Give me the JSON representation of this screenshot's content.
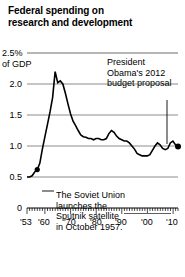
{
  "title": {
    "line1": "Federal spending on",
    "line2": "research and development"
  },
  "axes": {
    "y_unit_top": "2.5%",
    "y_unit_sub": "of GDP",
    "y_ticks": [
      "2.5",
      "2.0",
      "1.5",
      "1.0",
      "0.5",
      "0"
    ],
    "y_tick_labels_shown": [
      "2.0",
      "1.5",
      "1.0",
      "0.5",
      "0"
    ],
    "x_tick_labels": [
      "'53",
      "'60",
      "'70",
      "'80",
      "'90",
      "'00",
      "'10"
    ]
  },
  "annotations": {
    "obama": {
      "line1": "President",
      "line2": "Obama's 2012",
      "line3": "budget proposal"
    },
    "sputnik": {
      "line1": "The Soviet Union",
      "line2": "launches the",
      "line3": "Sputnik satellite",
      "line4": "in October 1957."
    }
  },
  "colors": {
    "line": "#000000",
    "gridline": "#8c8c8c",
    "axis": "#000000",
    "text": "#000000",
    "background": "#ffffff"
  },
  "chart_data": {
    "type": "line",
    "title": "Federal spending on research and development",
    "xlabel": "",
    "ylabel": "% of GDP",
    "ylim": [
      0,
      2.5
    ],
    "xlim": [
      1953,
      2012
    ],
    "grid": true,
    "legend": false,
    "yticks": [
      0,
      0.5,
      1.0,
      1.5,
      2.0,
      2.5
    ],
    "xticks": [
      1953,
      1960,
      1970,
      1980,
      1990,
      2000,
      2010
    ],
    "series": [
      {
        "name": "Federal R&D spending (% of GDP)",
        "x": [
          1953,
          1954,
          1955,
          1956,
          1957,
          1958,
          1959,
          1960,
          1961,
          1962,
          1963,
          1964,
          1965,
          1966,
          1967,
          1968,
          1969,
          1970,
          1971,
          1972,
          1973,
          1974,
          1975,
          1976,
          1977,
          1978,
          1979,
          1980,
          1981,
          1982,
          1983,
          1984,
          1985,
          1986,
          1987,
          1988,
          1989,
          1990,
          1991,
          1992,
          1993,
          1994,
          1995,
          1996,
          1997,
          1998,
          1999,
          2000,
          2001,
          2002,
          2003,
          2004,
          2005,
          2006,
          2007,
          2008,
          2009,
          2010,
          2011,
          2012
        ],
        "values": [
          0.5,
          0.5,
          0.52,
          0.58,
          0.62,
          0.72,
          0.95,
          1.15,
          1.35,
          1.55,
          1.78,
          2.2,
          2.02,
          2.05,
          2.0,
          1.85,
          1.68,
          1.52,
          1.4,
          1.33,
          1.25,
          1.18,
          1.15,
          1.14,
          1.12,
          1.12,
          1.1,
          1.12,
          1.12,
          1.1,
          1.1,
          1.12,
          1.2,
          1.25,
          1.22,
          1.16,
          1.12,
          1.1,
          1.08,
          1.08,
          1.05,
          1.0,
          0.95,
          0.88,
          0.86,
          0.84,
          0.84,
          0.84,
          0.86,
          0.93,
          1.0,
          1.05,
          1.02,
          0.96,
          0.94,
          0.96,
          1.05,
          1.08,
          1.02,
          0.99
        ]
      }
    ],
    "annotations": [
      {
        "text": "President Obama's 2012 budget proposal",
        "x": 2012,
        "y": 0.99
      },
      {
        "text": "The Soviet Union launches the Sputnik satellite in October 1957.",
        "x": 1957,
        "y": 0.62
      }
    ]
  }
}
